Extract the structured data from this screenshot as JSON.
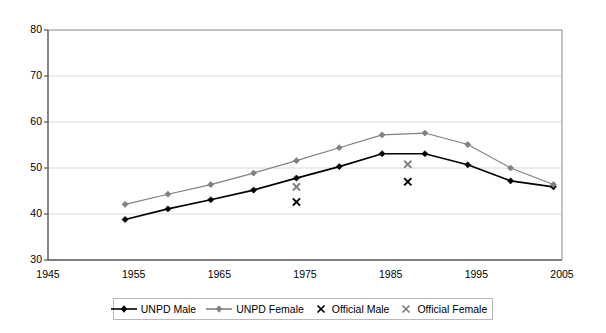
{
  "chart_data": {
    "type": "line",
    "title": "",
    "xlabel": "",
    "ylabel": "",
    "xlim": [
      1945,
      2005
    ],
    "ylim": [
      30,
      80
    ],
    "xticks": [
      1945,
      1955,
      1965,
      1975,
      1985,
      1995,
      2005
    ],
    "yticks": [
      30,
      40,
      50,
      60,
      70,
      80
    ],
    "grid": "horizontal",
    "legend_position": "bottom",
    "x": [
      1954,
      1959,
      1964,
      1969,
      1974,
      1979,
      1984,
      1989,
      1994,
      1999,
      2004
    ],
    "series": [
      {
        "name": "UNPD Male",
        "marker": "diamond",
        "style": "line",
        "color": "#000000",
        "values": [
          38.8,
          41.1,
          43.1,
          45.2,
          47.8,
          50.3,
          53.1,
          53.1,
          50.7,
          47.2,
          45.9
        ]
      },
      {
        "name": "UNPD Female",
        "marker": "diamond",
        "style": "line",
        "color": "#808080",
        "values": [
          42.1,
          44.3,
          46.4,
          48.9,
          51.6,
          54.4,
          57.2,
          57.6,
          55.1,
          50.0,
          46.4
        ]
      },
      {
        "name": "Official Male",
        "marker": "x",
        "style": "scatter",
        "color": "#000000",
        "points": [
          {
            "x": 1974,
            "y": 42.6
          },
          {
            "x": 1987,
            "y": 47.0
          }
        ]
      },
      {
        "name": "Official Female",
        "marker": "x",
        "style": "scatter",
        "color": "#808080",
        "points": [
          {
            "x": 1974,
            "y": 45.9
          },
          {
            "x": 1987,
            "y": 50.8
          }
        ]
      }
    ]
  },
  "axes": {
    "y_tick_labels": [
      "80",
      "70",
      "60",
      "50",
      "40",
      "30"
    ],
    "x_tick_labels": [
      "1945",
      "1955",
      "1965",
      "1975",
      "1985",
      "1995",
      "2005"
    ]
  },
  "legend": {
    "entries": [
      {
        "label": "UNPD Male",
        "marker": "line-diamond",
        "color": "#000000"
      },
      {
        "label": "UNPD Female",
        "marker": "line-diamond",
        "color": "#808080"
      },
      {
        "label": "Official Male",
        "marker": "x",
        "color": "#000000"
      },
      {
        "label": "Official Female",
        "marker": "x",
        "color": "#808080"
      }
    ]
  }
}
